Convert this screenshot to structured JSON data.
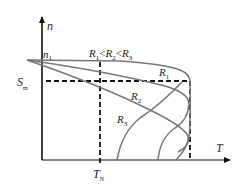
{
  "diagram": {
    "type": "mechanical-characteristic",
    "axes": {
      "y_label": "n",
      "x_label": "T"
    },
    "labels": {
      "n1": {
        "main": "n",
        "sub": "1"
      },
      "sm": {
        "main": "S",
        "sub": "m"
      },
      "tn": {
        "main": "T",
        "sub": "N"
      },
      "relation": {
        "r1": {
          "main": "R",
          "sub": "1"
        },
        "lt1": "<",
        "r2": {
          "main": "R",
          "sub": "2"
        },
        "lt2": "<",
        "r3": {
          "main": "R",
          "sub": "3"
        }
      },
      "curve_r1": {
        "main": "R",
        "sub": "1"
      },
      "curve_r2": {
        "main": "R",
        "sub": "2"
      },
      "curve_r3": {
        "main": "R",
        "sub": "3"
      }
    },
    "colors": {
      "axis": "#111111",
      "curve": "#777777",
      "dashed": "#111111",
      "text": "#222222"
    }
  }
}
